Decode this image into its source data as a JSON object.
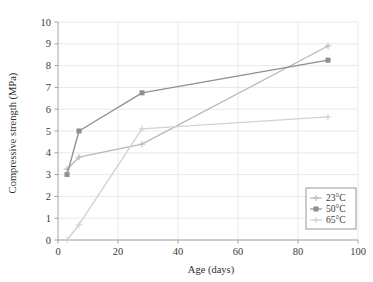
{
  "chart_data": {
    "type": "line",
    "title": "",
    "xlabel": "Age (days)",
    "ylabel": "Compressive strength (MPa)",
    "xlim": [
      0,
      100
    ],
    "ylim": [
      0,
      10
    ],
    "xticks": [
      0,
      20,
      40,
      60,
      80,
      100
    ],
    "yticks": [
      0,
      1,
      2,
      3,
      4,
      5,
      6,
      7,
      8,
      9,
      10
    ],
    "xtick_labels": [
      "0",
      "20",
      "40",
      "60",
      "80",
      "100"
    ],
    "ytick_labels": [
      "0",
      "1",
      "2",
      "3",
      "4",
      "5",
      "6",
      "7",
      "8",
      "9",
      "10"
    ],
    "grid": true,
    "grid_axis": "both",
    "legend_position": "lower-right",
    "series": [
      {
        "name": "23°C",
        "color": "#b9b9b9",
        "marker": "plus",
        "x": [
          3,
          7,
          28,
          90
        ],
        "y": [
          3.25,
          3.8,
          4.4,
          8.9
        ]
      },
      {
        "name": "50°C",
        "color": "#8f8f8f",
        "marker": "square",
        "x": [
          3,
          7,
          28,
          90
        ],
        "y": [
          3.0,
          5.0,
          6.75,
          8.25
        ]
      },
      {
        "name": "65°C",
        "color": "#d2d2d2",
        "marker": "plus",
        "x": [
          3,
          7,
          28,
          90
        ],
        "y": [
          0.0,
          0.7,
          5.1,
          5.65
        ]
      }
    ]
  },
  "legend": {
    "items": [
      {
        "label": "23°C",
        "marker": "plus-marker"
      },
      {
        "label": "50°C",
        "marker": "square-marker"
      },
      {
        "label": "65°C",
        "marker": "plus-marker"
      }
    ]
  },
  "colors": {
    "grid": "#e3e3e6",
    "axis": "#9a9a9a",
    "text": "#3a3a3a",
    "series_23": "#b9b9b9",
    "series_50": "#8f8f8f",
    "series_65": "#d2d2d2",
    "legend_border": "#8d8d8d",
    "background": "#ffffff"
  }
}
